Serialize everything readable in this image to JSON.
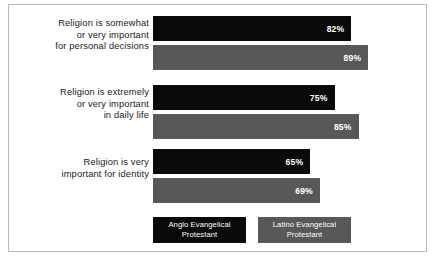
{
  "chart_data": {
    "type": "bar",
    "orientation": "horizontal",
    "title": "",
    "subtitle": "",
    "xlabel": "",
    "ylabel": "",
    "xlim": [
      0,
      100
    ],
    "grid": false,
    "legend_position": "bottom",
    "value_suffix": "%",
    "categories": [
      "Religion is somewhat or very important for personal decisions",
      "Religion is extremely or very important in daily life",
      "Religion is very important for identity"
    ],
    "category_lines": [
      [
        "Religion is somewhat",
        "or very important",
        "for personal decisions"
      ],
      [
        "Religion is extremely",
        "or very important",
        "in daily life"
      ],
      [
        "Religion is very",
        "important for identity"
      ]
    ],
    "series": [
      {
        "name": "Anglo Evangelical Protestant",
        "name_lines": [
          "Anglo Evangelical",
          "Protestant"
        ],
        "color": "#0a0a0a",
        "values": [
          82,
          75,
          65
        ],
        "labels": [
          "82%",
          "75%",
          "65%"
        ]
      },
      {
        "name": "Latino Evangelical Protestant",
        "name_lines": [
          "Latino Evangelical",
          "Protestant"
        ],
        "color": "#585858",
        "values": [
          89,
          85,
          69
        ],
        "labels": [
          "89%",
          "85%",
          "69%"
        ]
      }
    ]
  },
  "frame": {
    "border_color": "#b8b8b8",
    "background": "#ffffff"
  }
}
